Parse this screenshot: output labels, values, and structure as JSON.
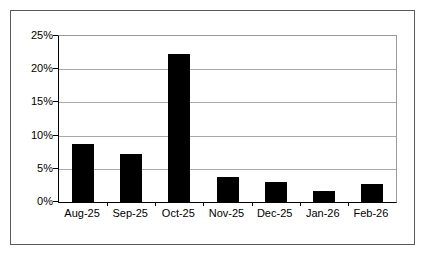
{
  "chart_data": {
    "type": "bar",
    "title": "",
    "subtitle": "",
    "xlabel": "",
    "ylabel": "",
    "categories": [
      "Aug-25",
      "Sep-25",
      "Oct-25",
      "Nov-25",
      "Dec-25",
      "Jan-26",
      "Feb-26"
    ],
    "values": [
      8.8,
      7.2,
      22.3,
      3.7,
      3.0,
      1.6,
      2.7
    ],
    "value_format": "percent",
    "ylim": [
      0,
      25
    ],
    "ytick_labels": [
      "0%",
      "5%",
      "10%",
      "15%",
      "20%",
      "25%"
    ],
    "ytick_values": [
      0,
      5,
      10,
      15,
      20,
      25
    ],
    "grid": true,
    "grid_axis": "y",
    "legend": false,
    "legend_position": "none",
    "bar_color": "#000000",
    "grid_color": "#a8a8a8",
    "axis_color": "#000000",
    "plot_background": "#ffffff",
    "frame_border_color": "#5a5a5a"
  }
}
